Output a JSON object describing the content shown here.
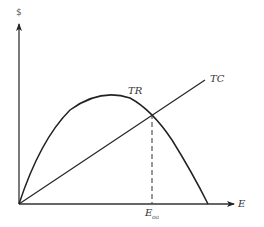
{
  "diagram": {
    "type": "economics-graph",
    "y_axis_label": "$",
    "x_axis_label": "E",
    "curves": [
      {
        "name": "TR",
        "label": "TR",
        "shape": "inverted-parabola"
      },
      {
        "name": "TC",
        "label": "TC",
        "shape": "straight-line-from-origin"
      }
    ],
    "marker": {
      "label": "E",
      "subscript": "oa",
      "style": "dashed-vertical-line"
    },
    "colors": {
      "line": "#222222",
      "background": "#ffffff"
    }
  }
}
